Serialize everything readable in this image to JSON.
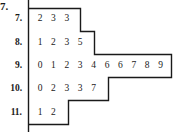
{
  "problem": {
    "number": "7."
  },
  "chart_data": {
    "type": "table",
    "subtype": "stem-and-leaf",
    "title": "",
    "rows": [
      {
        "stem": "7.",
        "leaves": [
          "2",
          "3",
          "3"
        ]
      },
      {
        "stem": "8.",
        "leaves": [
          "1",
          "2",
          "3",
          "5"
        ]
      },
      {
        "stem": "9.",
        "leaves": [
          "0",
          "1",
          "2",
          "3",
          "4",
          "6",
          "6",
          "7",
          "8",
          "9"
        ]
      },
      {
        "stem": "10.",
        "leaves": [
          "0",
          "2",
          "3",
          "3",
          "7"
        ]
      },
      {
        "stem": "11.",
        "leaves": [
          "1",
          "2"
        ]
      }
    ],
    "values": [
      7.2,
      7.3,
      7.3,
      8.1,
      8.2,
      8.3,
      8.5,
      9.0,
      9.1,
      9.2,
      9.3,
      9.4,
      9.6,
      9.6,
      9.7,
      9.8,
      9.9,
      10.0,
      10.2,
      10.3,
      10.3,
      10.7,
      11.1,
      11.2
    ],
    "layout": {
      "outline": "stepped box around leaves",
      "grid": false,
      "legend": "none"
    }
  }
}
